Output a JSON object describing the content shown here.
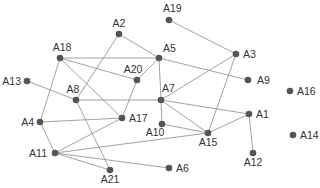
{
  "diagram": {
    "type": "network-graph",
    "colors": {
      "node": "#555555",
      "edge": "#8a8a8a",
      "label": "#333333",
      "background": "#ffffff"
    },
    "nodes": [
      {
        "id": "A1",
        "x": 249,
        "y": 114,
        "lx": 256,
        "ly": 118,
        "anchor": "start"
      },
      {
        "id": "A2",
        "x": 119,
        "y": 34,
        "lx": 119,
        "ly": 27,
        "anchor": "middle"
      },
      {
        "id": "A3",
        "x": 236,
        "y": 54,
        "lx": 243,
        "ly": 58,
        "anchor": "start"
      },
      {
        "id": "A4",
        "x": 40,
        "y": 122,
        "lx": 34,
        "ly": 126,
        "anchor": "end"
      },
      {
        "id": "A5",
        "x": 159,
        "y": 58,
        "lx": 163,
        "ly": 52,
        "anchor": "start"
      },
      {
        "id": "A6",
        "x": 169,
        "y": 168,
        "lx": 176,
        "ly": 172,
        "anchor": "start"
      },
      {
        "id": "A7",
        "x": 161,
        "y": 100,
        "lx": 162,
        "ly": 92,
        "anchor": "start"
      },
      {
        "id": "A8",
        "x": 76,
        "y": 100,
        "lx": 73,
        "ly": 93,
        "anchor": "middle"
      },
      {
        "id": "A9",
        "x": 248,
        "y": 80,
        "lx": 257,
        "ly": 84,
        "anchor": "start"
      },
      {
        "id": "A10",
        "x": 162,
        "y": 124,
        "lx": 155,
        "ly": 136,
        "anchor": "middle"
      },
      {
        "id": "A11",
        "x": 55,
        "y": 153,
        "lx": 47,
        "ly": 157,
        "anchor": "end"
      },
      {
        "id": "A12",
        "x": 253,
        "y": 153,
        "lx": 253,
        "ly": 166,
        "anchor": "middle"
      },
      {
        "id": "A13",
        "x": 27,
        "y": 81,
        "lx": 21,
        "ly": 85,
        "anchor": "end"
      },
      {
        "id": "A14",
        "x": 293,
        "y": 135,
        "lx": 300,
        "ly": 139,
        "anchor": "start"
      },
      {
        "id": "A15",
        "x": 208,
        "y": 133,
        "lx": 208,
        "ly": 146,
        "anchor": "middle"
      },
      {
        "id": "A16",
        "x": 290,
        "y": 91,
        "lx": 297,
        "ly": 95,
        "anchor": "start"
      },
      {
        "id": "A17",
        "x": 122,
        "y": 118,
        "lx": 129,
        "ly": 122,
        "anchor": "start"
      },
      {
        "id": "A18",
        "x": 60,
        "y": 58,
        "lx": 62,
        "ly": 51,
        "anchor": "middle"
      },
      {
        "id": "A19",
        "x": 169,
        "y": 20,
        "lx": 163,
        "ly": 12,
        "anchor": "start"
      },
      {
        "id": "A20",
        "x": 137,
        "y": 80,
        "lx": 133,
        "ly": 73,
        "anchor": "middle"
      },
      {
        "id": "A21",
        "x": 110,
        "y": 170,
        "lx": 110,
        "ly": 183,
        "anchor": "middle"
      }
    ],
    "edges": [
      [
        "A2",
        "A5"
      ],
      [
        "A2",
        "A8"
      ],
      [
        "A19",
        "A3"
      ],
      [
        "A18",
        "A5"
      ],
      [
        "A18",
        "A20"
      ],
      [
        "A18",
        "A4"
      ],
      [
        "A18",
        "A17"
      ],
      [
        "A5",
        "A20"
      ],
      [
        "A5",
        "A7"
      ],
      [
        "A5",
        "A9"
      ],
      [
        "A3",
        "A7"
      ],
      [
        "A3",
        "A15"
      ],
      [
        "A13",
        "A8"
      ],
      [
        "A8",
        "A7"
      ],
      [
        "A8",
        "A21"
      ],
      [
        "A20",
        "A17"
      ],
      [
        "A4",
        "A17"
      ],
      [
        "A4",
        "A11"
      ],
      [
        "A7",
        "A10"
      ],
      [
        "A7",
        "A1"
      ],
      [
        "A7",
        "A15"
      ],
      [
        "A10",
        "A15"
      ],
      [
        "A11",
        "A17"
      ],
      [
        "A11",
        "A15"
      ],
      [
        "A11",
        "A21"
      ],
      [
        "A11",
        "A6"
      ],
      [
        "A1",
        "A15"
      ],
      [
        "A1",
        "A12"
      ]
    ]
  }
}
